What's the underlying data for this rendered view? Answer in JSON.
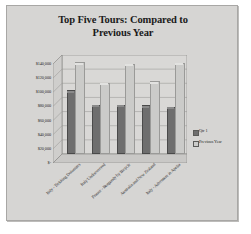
{
  "chart_data": {
    "type": "bar",
    "title": "Top Five Tours:  Compared to Previous Year",
    "title_line1": "Top Five Tours:  Compared to",
    "title_line2": "Previous Year",
    "xlabel": "",
    "ylabel": "",
    "ylim": [
      0,
      140000
    ],
    "grid": true,
    "legend_position": "right",
    "categories": [
      "Italy - Trekking Dolomites",
      "Italy Undiscovered",
      "France - Burgundy by Bicycle",
      "Australia and New Zealand",
      "Italy - Adventure in Apulia"
    ],
    "ytick_labels": [
      "$140,000",
      "$120,000",
      "$100,000",
      "$80,000",
      "$60,000",
      "$40,000",
      "$20,000",
      "$-"
    ],
    "ytick_values": [
      140000,
      120000,
      100000,
      80000,
      60000,
      40000,
      20000,
      0
    ],
    "series": [
      {
        "name": "Qtr 1",
        "color": "#6e6e6e",
        "values": [
          87000,
          67000,
          67000,
          66000,
          64000
        ]
      },
      {
        "name": "Previous Year",
        "color": "#cbcbc9",
        "values": [
          127000,
          98000,
          125000,
          100000,
          126000
        ]
      }
    ]
  },
  "legend": {
    "items": [
      {
        "label": "Qtr 1"
      },
      {
        "label": "Previous Year"
      }
    ]
  },
  "colors": {
    "background": "#d6d5d3",
    "series_1": "#6e6e6e",
    "series_2": "#cbcbc9",
    "text": "#2b2b2b"
  }
}
